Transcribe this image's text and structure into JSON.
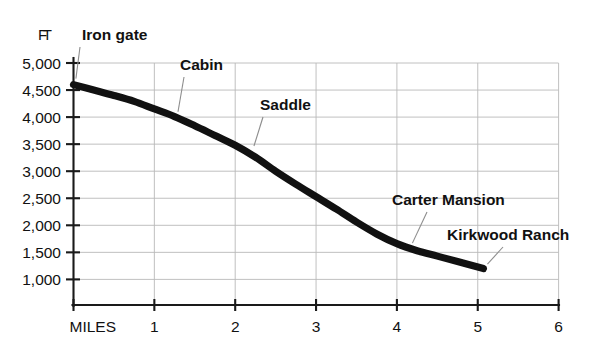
{
  "chart_data": {
    "type": "line",
    "title": "",
    "subtitle": "",
    "xlabel": "MILES",
    "ylabel": "FT",
    "xlim": [
      0,
      6
    ],
    "ylim": [
      700,
      5000
    ],
    "grid": true,
    "legend": "none",
    "x_ticks": [
      "MILES",
      "1",
      "2",
      "3",
      "4",
      "5",
      "6"
    ],
    "x_tick_values": [
      0,
      1,
      2,
      3,
      4,
      5,
      6
    ],
    "y_ticks": [
      "1,000",
      "1,500",
      "2,000",
      "2,500",
      "3,000",
      "3,500",
      "4,000",
      "4,500",
      "5,000"
    ],
    "y_tick_values": [
      1000,
      1500,
      2000,
      2500,
      3000,
      3500,
      4000,
      4500,
      5000
    ],
    "series": [
      {
        "name": "Trail elevation profile",
        "x": [
          0.0,
          0.25,
          0.5,
          0.75,
          1.0,
          1.25,
          1.5,
          1.75,
          2.0,
          2.25,
          2.5,
          2.75,
          3.0,
          3.25,
          3.5,
          3.75,
          4.0,
          4.25,
          4.5,
          4.75,
          5.07
        ],
        "values": [
          4600,
          4500,
          4400,
          4290,
          4150,
          4010,
          3840,
          3660,
          3480,
          3260,
          3000,
          2760,
          2530,
          2300,
          2060,
          1840,
          1660,
          1530,
          1430,
          1330,
          1200
        ]
      }
    ],
    "annotations": [
      {
        "label": "Iron gate",
        "x": 0.02,
        "y": 4600
      },
      {
        "label": "Cabin",
        "x": 1.28,
        "y": 3990
      },
      {
        "label": "Saddle",
        "x": 2.21,
        "y": 3360
      },
      {
        "label": "Carter Mansion",
        "x": 4.16,
        "y": 1570
      },
      {
        "label": "Kirkwood Ranch",
        "x": 5.07,
        "y": 1200
      }
    ]
  },
  "axis": {
    "unit_label": "FT",
    "x_origin_label": "MILES"
  },
  "colors": {
    "curve": "#111111",
    "grid": "#b9b9b9",
    "axis": "#1a1a1a",
    "leader": "#8d8d8d",
    "background": "#ffffff",
    "text": "#111111"
  }
}
